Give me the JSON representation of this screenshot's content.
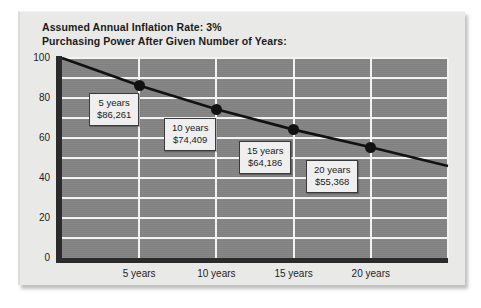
{
  "chart_data": {
    "type": "line",
    "title": "Assumed Annual Inflation Rate: 3%",
    "subtitle": "Purchasing Power After Given Number of Years:",
    "xlabel": "",
    "ylabel": "",
    "ylim": [
      0,
      100
    ],
    "yticks": [
      0,
      20,
      40,
      60,
      80,
      100
    ],
    "ytick_labels": [
      "0",
      "20",
      "40",
      "60",
      "80",
      "100"
    ],
    "minor_gridlines_y": [
      10,
      30,
      50,
      70,
      90
    ],
    "grid": true,
    "legend": "none",
    "xtick_labels": [
      "5 years",
      "10 years",
      "15 years",
      "20 years"
    ],
    "x": [
      0,
      5,
      10,
      15,
      20,
      25
    ],
    "values": [
      100,
      86.261,
      74.409,
      64.186,
      55.368,
      46.0
    ],
    "markers_at": [
      5,
      10,
      15,
      20
    ],
    "marker_values": [
      86.261,
      74.409,
      64.186,
      55.368
    ],
    "annotations": [
      {
        "years_label": "5 years",
        "amount": "$86,261",
        "value": 86.261
      },
      {
        "years_label": "10 years",
        "amount": "$74,409",
        "value": 74.409
      },
      {
        "years_label": "15 years",
        "amount": "$64,186",
        "value": 64.186
      },
      {
        "years_label": "20 years",
        "amount": "$55,368",
        "value": 55.368
      }
    ],
    "colors": {
      "plot_background": "#848484",
      "gridline": "#f3f3f3",
      "axis": "#2b2b2b",
      "series_line": "#111111",
      "marker": "#121212",
      "panel_background": "#e9e9e7",
      "callout_background": "#efefef",
      "text": "#1b1b1b"
    }
  }
}
